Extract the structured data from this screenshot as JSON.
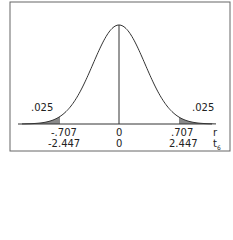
{
  "diagram": {
    "type": "normal-distribution",
    "tail_area_left": ".025",
    "tail_area_right": ".025",
    "axis_r": {
      "label": "r",
      "left": "-.707",
      "center": "0",
      "right": ".707"
    },
    "axis_t": {
      "label": "t",
      "subscript": "6",
      "left": "-2.447",
      "center": "0",
      "right": "2.447"
    },
    "colors": {
      "curve": "#333333",
      "shade": "#8a8a8a",
      "frame": "#555555"
    }
  }
}
